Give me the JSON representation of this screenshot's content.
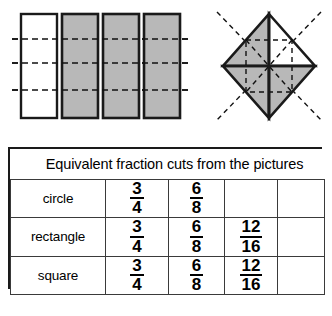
{
  "figures": {
    "rectangles": {
      "name": "four-vertical-bars",
      "count": 4,
      "shaded_count": 3,
      "unshaded_count": 1,
      "shaded_color": "#b8b8b8",
      "unshaded_color": "#ffffff",
      "outline_color": "#1a1a1a",
      "dashed_line_count": 3,
      "dashed_color": "#111111",
      "bars": [
        {
          "label": "bar-1",
          "shaded": false
        },
        {
          "label": "bar-2",
          "shaded": true
        },
        {
          "label": "bar-3",
          "shaded": true
        },
        {
          "label": "bar-4",
          "shaded": true
        }
      ]
    },
    "diamond": {
      "name": "diamond-square-quartered",
      "segments": 4,
      "shaded_count": 3,
      "unshaded_count": 1,
      "shaded_color": "#b8b8b8",
      "unshaded_color": "#ffffff",
      "outline_color": "#1a1a1a",
      "dashed_color": "#111111",
      "quadrants": [
        {
          "label": "top-left",
          "shaded": true
        },
        {
          "label": "top-right",
          "shaded": false
        },
        {
          "label": "bottom-left",
          "shaded": true
        },
        {
          "label": "bottom-right",
          "shaded": true
        }
      ]
    }
  },
  "table": {
    "title": "Equivalent fraction cuts from the pictures",
    "column_count": 5,
    "rows": [
      {
        "label": "circle",
        "cells": [
          {
            "numerator": "3",
            "denominator": "4"
          },
          {
            "numerator": "6",
            "denominator": "8"
          },
          {
            "numerator": "",
            "denominator": ""
          },
          {
            "numerator": "",
            "denominator": ""
          }
        ]
      },
      {
        "label": "rectangle",
        "cells": [
          {
            "numerator": "3",
            "denominator": "4"
          },
          {
            "numerator": "6",
            "denominator": "8"
          },
          {
            "numerator": "12",
            "denominator": "16"
          },
          {
            "numerator": "",
            "denominator": ""
          }
        ]
      },
      {
        "label": "square",
        "cells": [
          {
            "numerator": "3",
            "denominator": "4"
          },
          {
            "numerator": "6",
            "denominator": "8"
          },
          {
            "numerator": "12",
            "denominator": "16"
          },
          {
            "numerator": "",
            "denominator": ""
          }
        ]
      }
    ]
  }
}
